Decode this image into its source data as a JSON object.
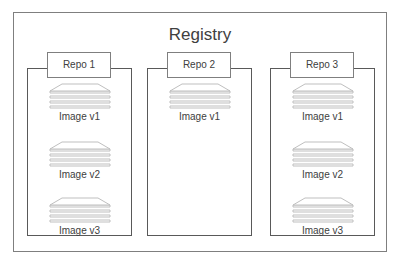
{
  "registry": {
    "title": "Registry"
  },
  "repos": [
    {
      "label": "Repo 1",
      "images": [
        "Image v1",
        "Image v2",
        "Image v3"
      ]
    },
    {
      "label": "Repo 2",
      "images": [
        "Image v1"
      ]
    },
    {
      "label": "Repo 3",
      "images": [
        "Image v1",
        "Image v2",
        "Image v3"
      ]
    }
  ],
  "colors": {
    "border": "#595959",
    "outer_border": "#7f7f7f",
    "layer_stroke": "#bfbfbf",
    "text": "#404040"
  },
  "icons": {
    "image": "layered-stack-icon"
  }
}
